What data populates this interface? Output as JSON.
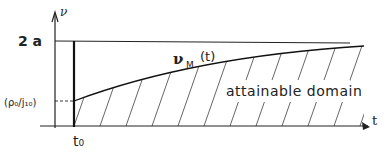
{
  "diagram": {
    "y_axis_label": "ν",
    "x_axis_label": "t",
    "upper_bound_label": "2 a",
    "initial_value_label": "(ρ₀/j₁₀)",
    "time_label": "t₀",
    "curve_label_main": "ν",
    "curve_label_sub": "M",
    "curve_label_arg": "(t)",
    "region_label": "attainable domain",
    "colors": {
      "ink": "#222222",
      "hatch": "#555555",
      "background": "#ffffff"
    }
  }
}
